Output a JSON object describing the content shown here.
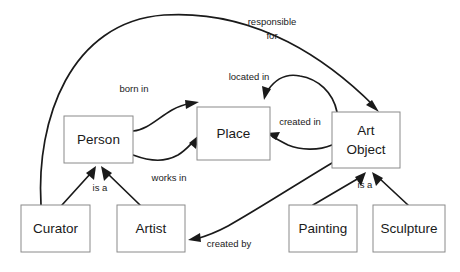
{
  "diagram": {
    "background_color": "#ffffff",
    "box_stroke_color": "#8a8a8a",
    "line_color": "#1a1a1a",
    "text_color": "#1a1a1a",
    "entities": [
      {
        "id": "person",
        "label": "Person",
        "label_line1": "Person",
        "label_line2": "",
        "x": 64,
        "y": 116,
        "w": 69,
        "h": 47
      },
      {
        "id": "place",
        "label": "Place",
        "label_line1": "Place",
        "label_line2": "",
        "x": 197,
        "y": 107,
        "w": 73,
        "h": 53
      },
      {
        "id": "artobject",
        "label": "Art Object",
        "label_line1": "Art",
        "label_line2": "Object",
        "x": 332,
        "y": 112,
        "w": 68,
        "h": 56
      },
      {
        "id": "curator",
        "label": "Curator",
        "label_line1": "Curator",
        "label_line2": "",
        "x": 21,
        "y": 205,
        "w": 69,
        "h": 47
      },
      {
        "id": "artist",
        "label": "Artist",
        "label_line1": "Artist",
        "label_line2": "",
        "x": 117,
        "y": 205,
        "w": 68,
        "h": 47
      },
      {
        "id": "painting",
        "label": "Painting",
        "label_line1": "Painting",
        "label_line2": "",
        "x": 289,
        "y": 205,
        "w": 68,
        "h": 47
      },
      {
        "id": "sculpture",
        "label": "Sculpture",
        "label_line1": "Sculpture",
        "label_line2": "",
        "x": 373,
        "y": 205,
        "w": 72,
        "h": 47
      }
    ],
    "relationships": [
      {
        "id": "responsible-for",
        "label": "responsible for",
        "label_line1": "responsible",
        "label_line2": "for",
        "from": "curator",
        "to": "artobject",
        "lx": 272,
        "ly": 22
      },
      {
        "id": "born-in",
        "label": "born in",
        "label_line1": "born in",
        "label_line2": "",
        "from": "person",
        "to": "place",
        "lx": 134,
        "ly": 89
      },
      {
        "id": "located-in",
        "label": "located in",
        "label_line1": "located in",
        "label_line2": "",
        "from": "artobject",
        "to": "place",
        "lx": 249,
        "ly": 77
      },
      {
        "id": "created-in",
        "label": "created in",
        "label_line1": "created in",
        "label_line2": "",
        "from": "artobject",
        "to": "place",
        "lx": 300,
        "ly": 122
      },
      {
        "id": "works-in",
        "label": "works in",
        "label_line1": "works in",
        "label_line2": "",
        "from": "person",
        "to": "place",
        "lx": 169,
        "ly": 178
      },
      {
        "id": "created-by",
        "label": "created by",
        "label_line1": "created by",
        "label_line2": "",
        "from": "artobject",
        "to": "artist",
        "lx": 229,
        "ly": 244
      },
      {
        "id": "is-a-person",
        "label": "is a",
        "label_line1": "is a",
        "label_line2": "",
        "from": "curator",
        "to": "person",
        "lx": 100,
        "ly": 188
      },
      {
        "id": "is-a-artobject",
        "label": "is a",
        "label_line1": "is a",
        "label_line2": "",
        "from": "painting",
        "to": "artobject",
        "lx": 365,
        "ly": 185
      }
    ]
  }
}
